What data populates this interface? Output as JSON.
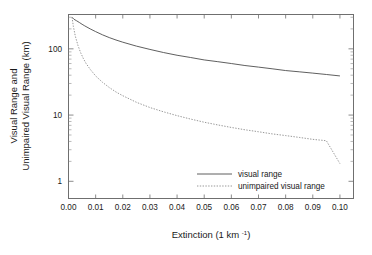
{
  "chart_data": {
    "type": "line",
    "title": "",
    "xlabel": "Extinction (1 km",
    "xlabel_sup": "-1",
    "xlabel_tail": ")",
    "ylabel_line1": "Visual Range and",
    "ylabel_line2": "Unimpaired Visual Range (km)",
    "xlim": [
      0.0,
      0.105
    ],
    "ylim": [
      0.55,
      330
    ],
    "yscale": "log",
    "xscale": "linear",
    "grid": false,
    "legend_position": "lower-right-inside",
    "xticks": [
      0.0,
      0.01,
      0.02,
      0.03,
      0.04,
      0.05,
      0.06,
      0.07,
      0.08,
      0.09,
      0.1
    ],
    "xticklabels": [
      "0.00",
      "0.01",
      "0.02",
      "0.03",
      "0.04",
      "0.05",
      "0.06",
      "0.07",
      "0.08",
      "0.09",
      "0.10"
    ],
    "yticks": [
      1,
      10,
      100
    ],
    "yticklabels": [
      "1",
      "10",
      "100"
    ],
    "yminorticks": [
      2,
      3,
      4,
      5,
      6,
      7,
      8,
      9,
      20,
      30,
      40,
      50,
      60,
      70,
      80,
      90,
      200,
      300
    ],
    "series": [
      {
        "name": "visual range",
        "style": "solid",
        "color": "#4d4d4d",
        "x": [
          0.0013,
          0.002,
          0.003,
          0.004,
          0.005,
          0.006,
          0.008,
          0.01,
          0.0125,
          0.015,
          0.0175,
          0.02,
          0.025,
          0.03,
          0.035,
          0.04,
          0.045,
          0.05,
          0.055,
          0.06,
          0.065,
          0.07,
          0.075,
          0.08,
          0.085,
          0.09,
          0.095,
          0.1
        ],
        "y": [
          300,
          280,
          265,
          250,
          235,
          222,
          200,
          182,
          163,
          148,
          136,
          126,
          110,
          98,
          88,
          80,
          74,
          68,
          64,
          60,
          56,
          53,
          50,
          47,
          45,
          43,
          41,
          39
        ]
      },
      {
        "name": "unimpaired visual range",
        "style": "dotted",
        "color": "#8c8c8c",
        "x": [
          0.0013,
          0.0018,
          0.0025,
          0.0035,
          0.0045,
          0.0055,
          0.0065,
          0.008,
          0.01,
          0.0125,
          0.015,
          0.0175,
          0.02,
          0.025,
          0.03,
          0.035,
          0.04,
          0.045,
          0.05,
          0.055,
          0.06,
          0.065,
          0.07,
          0.075,
          0.08,
          0.085,
          0.09,
          0.095,
          0.1
        ],
        "y": [
          300,
          217,
          156,
          112,
          87,
          71,
          60,
          49,
          39,
          31.3,
          26.1,
          22.3,
          19.6,
          15.6,
          13.0,
          11.2,
          9.8,
          8.7,
          7.8,
          7.1,
          6.5,
          6.0,
          5.6,
          5.2,
          4.9,
          4.6,
          4.3,
          4.1,
          3.9
        ],
        "y_actual": [
          300,
          217,
          156,
          112,
          87,
          71,
          60,
          49,
          39,
          31.3,
          26.1,
          22.3,
          19.6,
          15.6,
          13.0,
          11.2,
          9.8,
          8.7,
          7.8,
          7.1,
          6.5,
          6.0,
          5.6,
          5.2,
          4.9,
          4.6,
          4.3,
          4.1,
          1.85
        ]
      }
    ],
    "legend_entries": [
      {
        "label": "visual range",
        "style": "solid"
      },
      {
        "label": "unimpaired visual range",
        "style": "dotted"
      }
    ]
  }
}
